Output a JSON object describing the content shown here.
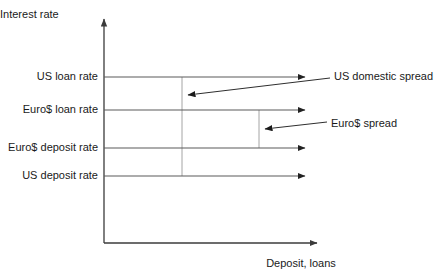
{
  "figure": {
    "type": "economics-line-diagram",
    "background_color": "#ffffff",
    "axis_color": "#3b3b3b",
    "rate_line_color": "#5a5a5a",
    "drop_line_color": "#9a9a9a",
    "leader_color": "#2e2e2e",
    "text_color": "#1a1a1a"
  },
  "axes": {
    "y_title": "Interest rate",
    "x_title": "Deposit, loans",
    "origin_x": 104,
    "origin_y": 243,
    "y_top": 14,
    "x_right": 322
  },
  "rates": [
    {
      "label": "US loan rate",
      "y": 77,
      "x_start": 104,
      "x_end": 310,
      "order": 1,
      "kind": "loan",
      "market": "US"
    },
    {
      "label": "Euro$ loan rate",
      "y": 110,
      "x_start": 104,
      "x_end": 310,
      "order": 2,
      "kind": "loan",
      "market": "Euro$"
    },
    {
      "label": "Euro$ deposit rate",
      "y": 148,
      "x_start": 104,
      "x_end": 310,
      "order": 3,
      "kind": "deposit",
      "market": "Euro$"
    },
    {
      "label": "US deposit rate",
      "y": 176,
      "x_start": 104,
      "x_end": 310,
      "order": 4,
      "kind": "deposit",
      "market": "US"
    }
  ],
  "spread_markers": [
    {
      "name": "us-domestic-spread-marker",
      "x": 182,
      "y_top": 77,
      "y_bottom": 176
    },
    {
      "name": "euro-dollar-spread-marker",
      "x": 259,
      "y_top": 110,
      "y_bottom": 148
    }
  ],
  "annotations": [
    {
      "label": "US domestic spread",
      "text_x": 334,
      "text_y": 71,
      "leader_from_x": 330,
      "leader_from_y": 78,
      "leader_to_x": 183,
      "leader_to_y": 96,
      "points_to": "us-domestic-spread-marker",
      "describes": "Gap between US loan rate and US deposit rate"
    },
    {
      "label": "Euro$ spread",
      "text_x": 331,
      "text_y": 118,
      "leader_from_x": 327,
      "leader_from_y": 122,
      "leader_to_x": 260,
      "leader_to_y": 130,
      "points_to": "euro-dollar-spread-marker",
      "describes": "Gap between Euro$ loan rate and Euro$ deposit rate"
    }
  ]
}
